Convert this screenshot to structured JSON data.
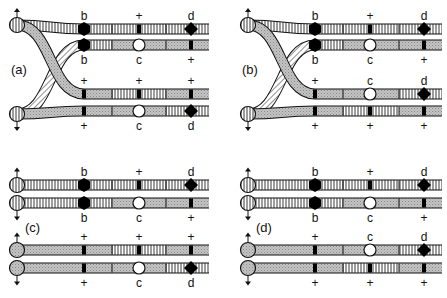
{
  "figure": {
    "patterns": {
      "vertical": "vertical-hatch",
      "diagonal": "diagonal-hatch",
      "shaded": "cross-hatch-gray"
    },
    "colors": {
      "stroke": "#111111",
      "shaded_fill": "#c8c8c8",
      "background": "#ffffff",
      "marker_black": "#000000",
      "marker_white": "#ffffff"
    }
  },
  "panels": [
    {
      "id": "a",
      "label": "(a)",
      "crossed": true,
      "rows": [
        {
          "top_labels": [
            "b",
            "+",
            "d"
          ],
          "bottom_labels": [],
          "markers": [
            "hexagon",
            "bar",
            "diamond"
          ],
          "segments": [
            "vertical",
            "vertical",
            "vertical"
          ]
        },
        {
          "top_labels": [],
          "bottom_labels": [
            "b",
            "c",
            "+"
          ],
          "markers": [
            "hexagon",
            "circle",
            "bar"
          ],
          "segments": [
            "vertical",
            "shaded",
            "shaded"
          ]
        },
        {
          "top_labels": [
            "+",
            "+",
            "+"
          ],
          "bottom_labels": [],
          "markers": [
            "bar",
            "bar",
            "bar"
          ],
          "segments": [
            "shaded",
            "vertical",
            "shaded"
          ]
        },
        {
          "top_labels": [],
          "bottom_labels": [
            "+",
            "c",
            "d"
          ],
          "markers": [
            "bar",
            "circle",
            "diamond"
          ],
          "segments": [
            "shaded",
            "shaded",
            "vertical"
          ]
        }
      ]
    },
    {
      "id": "b",
      "label": "(b)",
      "crossed": true,
      "rows": [
        {
          "top_labels": [
            "b",
            "+",
            "d"
          ],
          "bottom_labels": [],
          "markers": [
            "hexagon",
            "bar",
            "diamond"
          ],
          "segments": [
            "vertical",
            "vertical",
            "vertical"
          ]
        },
        {
          "top_labels": [],
          "bottom_labels": [
            "b",
            "c",
            "+"
          ],
          "markers": [
            "hexagon",
            "circle",
            "bar"
          ],
          "segments": [
            "vertical",
            "shaded",
            "shaded"
          ]
        },
        {
          "top_labels": [
            "+",
            "c",
            "d"
          ],
          "bottom_labels": [],
          "markers": [
            "bar",
            "circle",
            "diamond"
          ],
          "segments": [
            "shaded",
            "shaded",
            "vertical"
          ]
        },
        {
          "top_labels": [],
          "bottom_labels": [
            "+",
            "+",
            "+"
          ],
          "markers": [
            "bar",
            "bar",
            "bar"
          ],
          "segments": [
            "shaded",
            "vertical",
            "shaded"
          ]
        }
      ]
    },
    {
      "id": "c",
      "label": "(c)",
      "crossed": false,
      "rows": [
        {
          "top_labels": [
            "b",
            "+",
            "d"
          ],
          "bottom_labels": [],
          "markers": [
            "hexagon",
            "bar",
            "diamond"
          ],
          "segments": [
            "vertical",
            "vertical",
            "vertical"
          ]
        },
        {
          "top_labels": [],
          "bottom_labels": [
            "b",
            "c",
            "+"
          ],
          "markers": [
            "hexagon",
            "circle",
            "bar"
          ],
          "segments": [
            "vertical",
            "shaded",
            "shaded"
          ]
        },
        {
          "top_labels": [
            "+",
            "+",
            "+"
          ],
          "bottom_labels": [],
          "markers": [
            "bar",
            "bar",
            "bar"
          ],
          "segments": [
            "shaded",
            "vertical",
            "shaded"
          ]
        },
        {
          "top_labels": [],
          "bottom_labels": [
            "+",
            "c",
            "d"
          ],
          "markers": [
            "bar",
            "circle",
            "diamond"
          ],
          "segments": [
            "shaded",
            "shaded",
            "vertical"
          ]
        }
      ]
    },
    {
      "id": "d",
      "label": "(d)",
      "crossed": false,
      "rows": [
        {
          "top_labels": [
            "b",
            "+",
            "d"
          ],
          "bottom_labels": [],
          "markers": [
            "hexagon",
            "bar",
            "diamond"
          ],
          "segments": [
            "vertical",
            "vertical",
            "vertical"
          ]
        },
        {
          "top_labels": [],
          "bottom_labels": [
            "b",
            "c",
            "+"
          ],
          "markers": [
            "hexagon",
            "circle",
            "bar"
          ],
          "segments": [
            "vertical",
            "shaded",
            "shaded"
          ]
        },
        {
          "top_labels": [
            "+",
            "c",
            "d"
          ],
          "bottom_labels": [],
          "markers": [
            "bar",
            "circle",
            "diamond"
          ],
          "segments": [
            "shaded",
            "shaded",
            "vertical"
          ]
        },
        {
          "top_labels": [],
          "bottom_labels": [
            "+",
            "+",
            "+"
          ],
          "markers": [
            "bar",
            "bar",
            "bar"
          ],
          "segments": [
            "shaded",
            "vertical",
            "shaded"
          ]
        }
      ]
    }
  ]
}
